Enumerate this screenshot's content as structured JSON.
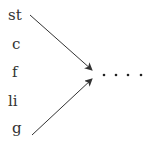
{
  "diagram": {
    "labels": [
      "st",
      "c",
      "f",
      "li",
      "g"
    ],
    "ellipsis": "· · · ·",
    "arrows": [
      {
        "from": "st",
        "to": "ellipsis"
      },
      {
        "from": "g",
        "to": "ellipsis"
      }
    ],
    "colors": {
      "text": "#333333",
      "line": "#333333"
    }
  }
}
